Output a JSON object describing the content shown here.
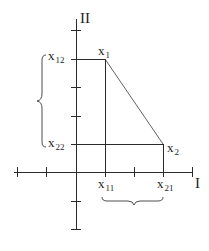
{
  "diagram": {
    "type": "coordinate-plane-line-segment",
    "axes": {
      "horizontal": {
        "label": "I"
      },
      "vertical": {
        "label": "II"
      }
    },
    "points": [
      {
        "id": "x1",
        "base": "x",
        "sub": "1",
        "coords": {
          "I": 1,
          "II": 4
        }
      },
      {
        "id": "x2",
        "base": "x",
        "sub": "2",
        "coords": {
          "I": 3,
          "II": 1
        }
      }
    ],
    "tick_labels": {
      "x11": {
        "base": "x",
        "sub": "11"
      },
      "x21": {
        "base": "x",
        "sub": "21"
      },
      "x12": {
        "base": "x",
        "sub": "12"
      },
      "x22": {
        "base": "x",
        "sub": "22"
      }
    },
    "braces": [
      {
        "id": "vertical-brace",
        "spans": [
          "x12",
          "x22"
        ]
      },
      {
        "id": "horizontal-brace",
        "spans": [
          "x11",
          "x21"
        ]
      }
    ],
    "colors": {
      "stroke": "#2a2a2a",
      "background": "#ffffff"
    }
  }
}
